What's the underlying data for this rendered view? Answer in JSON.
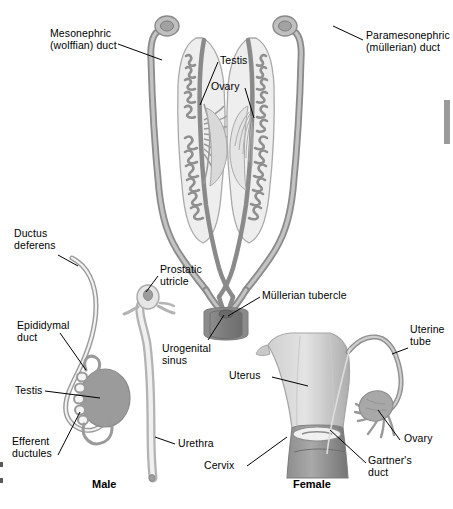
{
  "figure": {
    "type": "anatomical-diagram",
    "background": "#ffffff"
  },
  "palette": {
    "duct_outline": "#8a8a8a",
    "duct_fill": "#b3b3b3",
    "gonad_fill": "#9b9b9b",
    "pale_fill": "#e9e9e9",
    "sinus_dark": "#777777",
    "sinus_mid": "#8f8f8f",
    "uterus_light": "#d8d8d8",
    "uterus_mid": "#bcbcbc",
    "text": "#000000",
    "leader": "#000000",
    "edge_bar": "#9a9a9a"
  },
  "labels": {
    "mesonephric": "Mesonephric\n(wolffian) duct",
    "paramesonephric": "Paramesonephric\n(müllerian) duct",
    "testis_top": "Testis",
    "ovary_top": "Ovary",
    "ductus_deferens": "Ductus\ndeferens",
    "epididymal_duct": "Epididymal\nduct",
    "testis_male": "Testis",
    "efferent_ductules": "Efferent\nductules",
    "prostatic_utricle": "Prostatic\nutricle",
    "urogenital_sinus": "Urogenital\nsinus",
    "urethra": "Urethra",
    "mullerian_tubercle": "Müllerian tubercle",
    "uterus": "Uterus",
    "uterine_tube": "Uterine\ntube",
    "ovary_female": "Ovary",
    "gartners_duct": "Gartner's\nduct",
    "cervix": "Cervix"
  },
  "captions": {
    "male": "Male",
    "female": "Female"
  }
}
